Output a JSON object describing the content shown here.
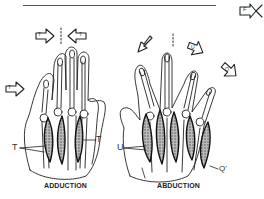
{
  "figure": {
    "left_panel": {
      "caption": "ADDUCTION",
      "muscle_labels": [
        "T",
        "T"
      ],
      "arrow_labels": [
        "T",
        "T",
        "T"
      ]
    },
    "right_panel": {
      "caption": "ABDUCTION",
      "muscle_labels": [
        "U",
        "Q'"
      ],
      "arrow_labels": [
        "U",
        "U",
        "Q"
      ]
    },
    "corner_arrow_label": "F"
  },
  "colors": {
    "ink": "#222222",
    "muscle_fill": "#777777",
    "background": "#ffffff"
  }
}
